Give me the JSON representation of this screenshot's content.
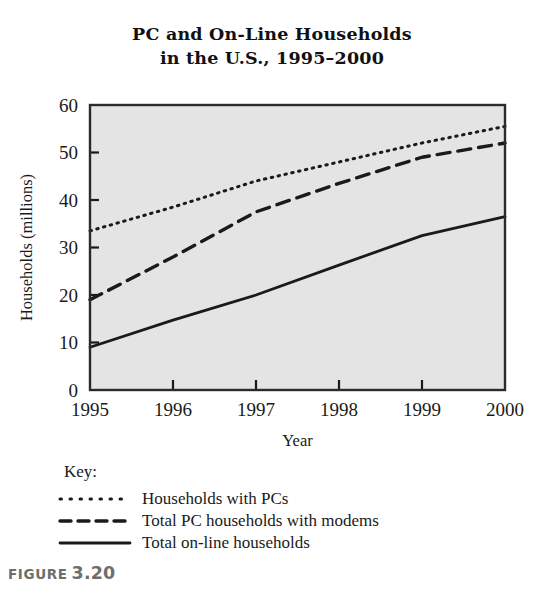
{
  "figure": {
    "caption_word": "FIGURE",
    "caption_number": "3.20",
    "caption_color": "#6e6e6e"
  },
  "chart_data": {
    "type": "line",
    "title": "PC and On-Line Households in the U.S., 1995–2000",
    "title_line1": "PC and On-Line Households",
    "title_line2": "in the U.S., 1995–2000",
    "xlabel": "Year",
    "ylabel": "Households (millions)",
    "x": [
      1995,
      1996,
      1997,
      1998,
      1999,
      2000
    ],
    "categories": [
      "1995",
      "1996",
      "1997",
      "1998",
      "1999",
      "2000"
    ],
    "xticklabels": [
      "1995",
      "1996",
      "1997",
      "1998",
      "1999",
      "2000"
    ],
    "yticklabels": [
      "0",
      "10",
      "20",
      "30",
      "40",
      "50",
      "60"
    ],
    "yticks": [
      0,
      10,
      20,
      30,
      40,
      50,
      60
    ],
    "xlim": [
      1995,
      2000
    ],
    "ylim": [
      0,
      60
    ],
    "grid": false,
    "legend_position": "below-axes",
    "legend_title": "Key:",
    "plot_background": "#e4e4e4",
    "line_color": "#1a1a1a",
    "series": [
      {
        "name": "Households with PCs",
        "style": "dotted",
        "values": [
          33.5,
          38.5,
          44.0,
          48.0,
          52.0,
          55.5
        ]
      },
      {
        "name": "Total PC households with modems",
        "style": "dashed",
        "values": [
          19.0,
          28.0,
          37.5,
          43.5,
          49.0,
          52.0
        ]
      },
      {
        "name": "Total on-line households",
        "style": "solid",
        "values": [
          9.0,
          14.7,
          20.0,
          26.3,
          32.5,
          36.5
        ]
      }
    ]
  }
}
